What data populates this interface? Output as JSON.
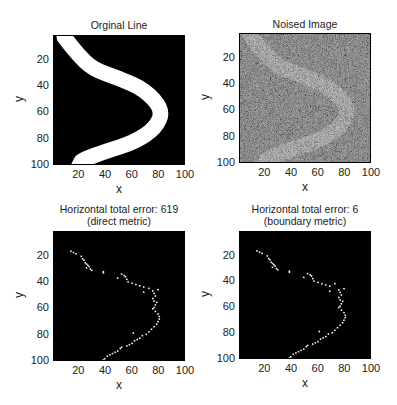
{
  "chart_data": [
    {
      "type": "heatmap",
      "title": "Orginal Line",
      "xlabel": "x",
      "ylabel": "y",
      "xticks": [
        20,
        40,
        60,
        80,
        100
      ],
      "yticks": [
        20,
        40,
        60,
        80,
        100
      ],
      "xlim": [
        1,
        100
      ],
      "ylim": [
        1,
        100
      ],
      "y_reversed": true,
      "description": "Binary image: black background with a thick white curved band shaped like '>' starting near (5,1), bending through (84,58), ending near (15,100)",
      "centerline": [
        [
          8,
          1
        ],
        [
          18,
          14
        ],
        [
          30,
          26
        ],
        [
          50,
          33
        ],
        [
          70,
          42
        ],
        [
          84,
          58
        ],
        [
          78,
          72
        ],
        [
          62,
          83
        ],
        [
          40,
          90
        ],
        [
          24,
          96
        ],
        [
          18,
          100
        ]
      ],
      "band_width": 12
    },
    {
      "type": "heatmap",
      "title": "Noised Image",
      "xlabel": "x",
      "ylabel": "y",
      "xticks": [
        20,
        40,
        60,
        80,
        100
      ],
      "yticks": [
        20,
        40,
        60,
        80,
        100
      ],
      "xlim": [
        1,
        100
      ],
      "ylim": [
        1,
        100
      ],
      "y_reversed": true,
      "description": "Grayscale noisy version of the original line; band visible as lighter gray over dark gray noise"
    },
    {
      "type": "scatter",
      "title": "Horizontal total error: 619",
      "subtitle": "(direct metric)",
      "xlabel": "x",
      "ylabel": "y",
      "xticks": [
        20,
        40,
        60,
        80,
        100
      ],
      "yticks": [
        20,
        40,
        60,
        80,
        100
      ],
      "xlim": [
        1,
        100
      ],
      "ylim": [
        1,
        100
      ],
      "y_reversed": true,
      "total_error": 619,
      "points": [
        [
          13,
          15
        ],
        [
          15,
          16
        ],
        [
          17,
          17
        ],
        [
          21,
          19
        ],
        [
          22,
          21
        ],
        [
          23,
          22
        ],
        [
          24,
          24
        ],
        [
          25,
          25
        ],
        [
          26,
          26
        ],
        [
          27,
          27
        ],
        [
          25,
          28
        ],
        [
          28,
          29
        ],
        [
          29,
          30
        ],
        [
          38,
          31
        ],
        [
          38,
          32
        ],
        [
          52,
          33
        ],
        [
          54,
          34
        ],
        [
          55,
          35
        ],
        [
          49,
          36
        ],
        [
          56,
          37
        ],
        [
          57,
          39
        ],
        [
          60,
          40
        ],
        [
          63,
          41
        ],
        [
          66,
          42
        ],
        [
          69,
          43
        ],
        [
          73,
          44
        ],
        [
          80,
          45
        ],
        [
          76,
          46
        ],
        [
          77,
          48
        ],
        [
          69,
          47
        ],
        [
          78,
          50
        ],
        [
          76,
          52
        ],
        [
          77,
          54
        ],
        [
          79,
          55
        ],
        [
          78,
          57
        ],
        [
          77,
          59
        ],
        [
          76,
          60
        ],
        [
          78,
          62
        ],
        [
          80,
          64
        ],
        [
          81,
          66
        ],
        [
          81,
          68
        ],
        [
          80,
          70
        ],
        [
          79,
          72
        ],
        [
          77,
          74
        ],
        [
          75,
          76
        ],
        [
          73,
          78
        ],
        [
          71,
          80
        ],
        [
          68,
          81
        ],
        [
          66,
          83
        ],
        [
          64,
          84
        ],
        [
          62,
          85
        ],
        [
          61,
          79
        ],
        [
          60,
          87
        ],
        [
          58,
          88
        ],
        [
          56,
          89
        ],
        [
          52,
          90
        ],
        [
          51,
          91
        ],
        [
          49,
          93
        ],
        [
          47,
          94
        ],
        [
          45,
          95
        ],
        [
          43,
          96
        ],
        [
          41,
          97
        ],
        [
          39,
          99
        ],
        [
          38,
          100
        ]
      ]
    },
    {
      "type": "scatter",
      "title": "Horizontal total error: 6",
      "subtitle": "(boundary metric)",
      "xlabel": "x",
      "ylabel": "y",
      "xticks": [
        20,
        40,
        60,
        80,
        100
      ],
      "yticks": [
        20,
        40,
        60,
        80,
        100
      ],
      "xlim": [
        1,
        100
      ],
      "ylim": [
        1,
        100
      ],
      "y_reversed": true,
      "total_error": 6,
      "points": [
        [
          13,
          15
        ],
        [
          15,
          16
        ],
        [
          17,
          17
        ],
        [
          21,
          19
        ],
        [
          22,
          21
        ],
        [
          23,
          22
        ],
        [
          24,
          24
        ],
        [
          25,
          25
        ],
        [
          26,
          26
        ],
        [
          27,
          27
        ],
        [
          25,
          28
        ],
        [
          28,
          29
        ],
        [
          29,
          30
        ],
        [
          38,
          31
        ],
        [
          38,
          32
        ],
        [
          52,
          33
        ],
        [
          54,
          34
        ],
        [
          55,
          35
        ],
        [
          49,
          36
        ],
        [
          56,
          37
        ],
        [
          57,
          39
        ],
        [
          60,
          40
        ],
        [
          63,
          41
        ],
        [
          66,
          42
        ],
        [
          69,
          43
        ],
        [
          73,
          41
        ],
        [
          80,
          45
        ],
        [
          76,
          46
        ],
        [
          77,
          48
        ],
        [
          69,
          47
        ],
        [
          78,
          50
        ],
        [
          76,
          52
        ],
        [
          77,
          54
        ],
        [
          79,
          55
        ],
        [
          78,
          57
        ],
        [
          77,
          59
        ],
        [
          76,
          60
        ],
        [
          78,
          62
        ],
        [
          80,
          64
        ],
        [
          81,
          66
        ],
        [
          81,
          68
        ],
        [
          80,
          70
        ],
        [
          79,
          72
        ],
        [
          77,
          74
        ],
        [
          75,
          76
        ],
        [
          73,
          78
        ],
        [
          71,
          80
        ],
        [
          68,
          81
        ],
        [
          66,
          83
        ],
        [
          64,
          84
        ],
        [
          62,
          85
        ],
        [
          61,
          79
        ],
        [
          60,
          87
        ],
        [
          58,
          88
        ],
        [
          56,
          89
        ],
        [
          52,
          90
        ],
        [
          51,
          91
        ],
        [
          49,
          93
        ],
        [
          47,
          94
        ],
        [
          45,
          95
        ],
        [
          43,
          96
        ],
        [
          41,
          97
        ],
        [
          39,
          99
        ],
        [
          38,
          100
        ]
      ]
    }
  ],
  "panels": {
    "tl": {
      "title": "Orginal Line",
      "xlabel": "x",
      "ylabel": "y"
    },
    "tr": {
      "title": "Noised Image",
      "xlabel": "x",
      "ylabel": "y"
    },
    "bl": {
      "title": "Horizontal total error: 619",
      "subtitle": "(direct metric)",
      "xlabel": "x",
      "ylabel": "y"
    },
    "br": {
      "title": "Horizontal total error: 6",
      "subtitle": "(boundary metric)",
      "xlabel": "x",
      "ylabel": "y"
    }
  },
  "ticks": {
    "t20": "20",
    "t40": "40",
    "t60": "60",
    "t80": "80",
    "t100": "100"
  }
}
